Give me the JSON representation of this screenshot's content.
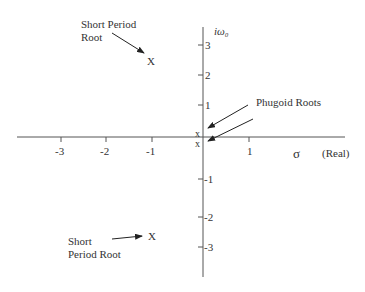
{
  "diagram": {
    "type": "s-plane root locus",
    "axes": {
      "real_label_symbol": "σ",
      "real_label_text": "(Real)",
      "imag_label": "iω₀",
      "real_ticks": [
        "-3",
        "-2",
        "-1",
        "1"
      ],
      "imag_ticks_pos": [
        "3",
        "2",
        "1"
      ],
      "imag_ticks_neg": [
        "-1",
        "-2",
        "-3"
      ]
    },
    "roots": {
      "marker": "X",
      "phugoid_marker": "x",
      "short_period_upper": {
        "label_line1": "Short Period",
        "label_line2": "Root"
      },
      "short_period_lower": {
        "label_line1": "Short",
        "label_line2": "Period Root"
      },
      "phugoid": {
        "label": "Phugoid Roots"
      }
    }
  }
}
